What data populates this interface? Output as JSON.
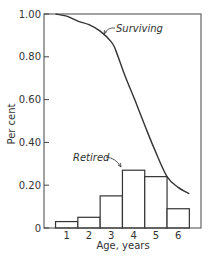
{
  "chart_data": {
    "type": "bar+line",
    "title": "",
    "xlabel": "Age, years",
    "ylabel": "Per cent",
    "ylim": [
      0,
      1.0
    ],
    "xlim": [
      0.5,
      7.0
    ],
    "y_ticks": [
      {
        "value": 0,
        "label": "0"
      },
      {
        "value": 0.2,
        "label": "0.20"
      },
      {
        "value": 0.4,
        "label": "0.40"
      },
      {
        "value": 0.6,
        "label": "0.60"
      },
      {
        "value": 0.8,
        "label": "0.80"
      },
      {
        "value": 1.0,
        "label": "1.00"
      }
    ],
    "x_ticks": [
      "1",
      "2",
      "3",
      "4",
      "5",
      "6"
    ],
    "grid": false,
    "series": [
      {
        "name": "Retired",
        "type": "bar",
        "categories": [
          1,
          2,
          3,
          4,
          5,
          6
        ],
        "values": [
          0.03,
          0.05,
          0.15,
          0.27,
          0.24,
          0.09
        ]
      },
      {
        "name": "Surviving",
        "type": "line",
        "x": [
          0.5,
          1.0,
          1.5,
          2.0,
          2.5,
          3.0,
          3.2,
          3.6,
          4.05,
          4.5,
          4.95,
          5.5,
          6.0,
          6.5
        ],
        "values": [
          1.0,
          0.99,
          0.967,
          0.95,
          0.92,
          0.87,
          0.83,
          0.715,
          0.6,
          0.48,
          0.365,
          0.24,
          0.19,
          0.16
        ]
      }
    ],
    "annotations": [
      {
        "text": "Surviving",
        "target_series": "Surviving"
      },
      {
        "text": "Retired",
        "target_series": "Retired"
      }
    ]
  },
  "labels": {
    "xlabel": "Age, years",
    "ylabel": "Per cent",
    "surviving": "Surviving",
    "retired": "Retired"
  }
}
